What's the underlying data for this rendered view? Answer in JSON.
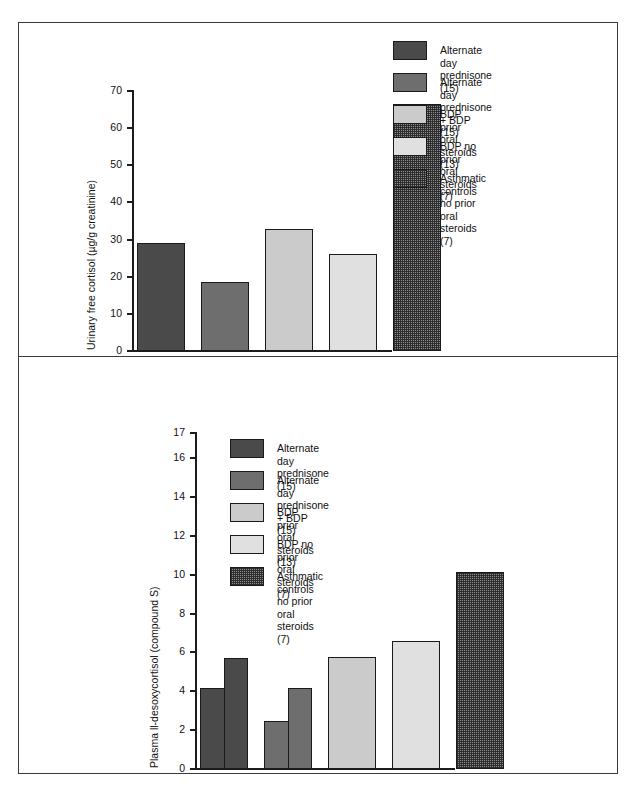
{
  "legend": {
    "entries": [
      {
        "label": "Alternate day prednisone (15)",
        "color": "#4a4a4a",
        "swatch": "solid-dark-gray"
      },
      {
        "label": "Alternate day prednisone + BDP (15)",
        "color": "#6e6e6e",
        "swatch": "solid-medium-gray"
      },
      {
        "label": "BDP prior oral steroids (13)",
        "color": "#cbcbcb",
        "swatch": "solid-light-gray"
      },
      {
        "label": "BDP no prior oral steroids (7)",
        "color": "#e0e0e0",
        "swatch": "solid-very-light-gray"
      },
      {
        "label": "Asthmatic controls no prior\noral steroids (7)",
        "color": "#8c8c8c",
        "swatch": "checkered-pattern"
      }
    ]
  },
  "chart_data": [
    {
      "type": "bar",
      "title": "",
      "xlabel": "",
      "ylabel": "Urinary free cortisol (µg/g creatinine)",
      "ylim": [
        0,
        70
      ],
      "yticks": [
        0,
        10,
        20,
        30,
        40,
        50,
        60,
        70
      ],
      "ytick_labels": [
        "0",
        "10",
        "20",
        "30",
        "40",
        "50",
        "60",
        "70"
      ],
      "grid": false,
      "legend_position": "top-right",
      "categories": [
        "Alternate day prednisone (15)",
        "Alternate day prednisone + BDP (15)",
        "BDP prior oral steroids (13)",
        "BDP no prior oral steroids (7)",
        "Asthmatic controls no prior oral steroids (7)"
      ],
      "values": [
        28.7,
        18.2,
        32.7,
        25.8,
        66.3
      ]
    },
    {
      "type": "bar",
      "title": "",
      "xlabel": "",
      "ylabel": "Plasma ll-desoxycortisol (compound S)",
      "ylim": [
        0,
        17
      ],
      "yticks": [
        0,
        2,
        4,
        6,
        8,
        10,
        12,
        14,
        16,
        17
      ],
      "ytick_labels": [
        "0",
        "2",
        "4",
        "6",
        "8",
        "10",
        "12",
        "14",
        "16",
        "17"
      ],
      "grid": false,
      "legend_position": "top-left",
      "categories": [
        "Alternate day prednisone (15)",
        "Alternate day prednisone + BDP (15)",
        "BDP prior oral steroids (13)",
        "BDP no prior oral steroids (7)",
        "Asthmatic controls no prior oral steroids (7)"
      ],
      "series": [
        {
          "name": "basal",
          "values": [
            4.1,
            2.4,
            5.7,
            6.55,
            10.1
          ]
        },
        {
          "name": "post-metyrapone",
          "values": [
            5.65,
            4.1,
            null,
            null,
            null
          ]
        }
      ],
      "values": [
        4.1,
        2.4,
        5.7,
        6.55,
        10.1
      ]
    }
  ]
}
